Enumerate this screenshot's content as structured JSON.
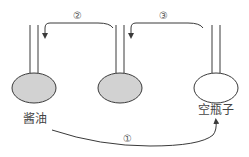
{
  "diagram": {
    "type": "process-flow",
    "bottles": [
      {
        "id": "soy-sauce",
        "label": "酱油",
        "filled": true
      },
      {
        "id": "middle",
        "label": "",
        "filled": true
      },
      {
        "id": "empty",
        "label": "空瓶子",
        "filled": false
      }
    ],
    "steps": [
      {
        "id": "step-1",
        "label": "①",
        "from": "soy-sauce",
        "to": "empty"
      },
      {
        "id": "step-2",
        "label": "②",
        "from": "middle",
        "to": "soy-sauce"
      },
      {
        "id": "step-3",
        "label": "③",
        "from": "empty",
        "to": "middle"
      }
    ],
    "colors": {
      "stroke": "#3a3a3a",
      "fill_liquid": "#d2d2d2",
      "fill_empty": "#ffffff"
    }
  }
}
